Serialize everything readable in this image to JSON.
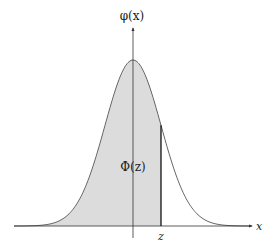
{
  "chart_data": {
    "type": "area",
    "title": "",
    "curve": "standard normal pdf",
    "x_label": "x",
    "y_label": "φ(x)",
    "shaded_region_label": "Φ(z)",
    "marker_label": "z",
    "z_value_approx": 1.0,
    "x_range": [
      -4.2,
      4.3
    ],
    "peak": {
      "x": 0,
      "y": 0.399
    },
    "shaded_from": "-infinity",
    "shaded_to": "z",
    "grid": false,
    "legend": "none"
  },
  "labels": {
    "y_axis": "φ(x)",
    "x_axis": "x",
    "area": "Φ(z)",
    "z_tick": "z"
  },
  "colors": {
    "fill": "#dcdcdc",
    "curve": "#555555",
    "axis": "#333333",
    "z_line": "#111111"
  }
}
